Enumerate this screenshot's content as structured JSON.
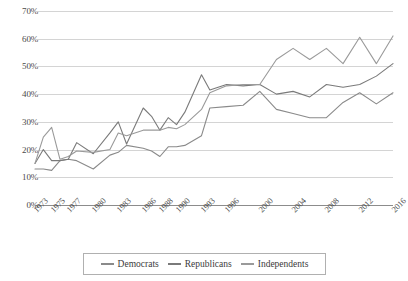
{
  "chart_data": {
    "type": "line",
    "title": "",
    "subtitle": "",
    "xlabel": "",
    "ylabel": "",
    "ylim": [
      0,
      70
    ],
    "xlim": [
      1973,
      2016
    ],
    "grid": true,
    "legend_position": "bottom",
    "y_ticks": [
      "0%",
      "10%",
      "20%",
      "30%",
      "40%",
      "50%",
      "60%",
      "70%"
    ],
    "y_tick_values": [
      0,
      10,
      20,
      30,
      40,
      50,
      60,
      70
    ],
    "x_tick_labels": [
      "1973",
      "1975",
      "1977",
      "1980",
      "1983",
      "1986",
      "1988",
      "1990",
      "1993",
      "1996",
      "2000",
      "2004",
      "2008",
      "2012",
      "2016"
    ],
    "x": [
      1973,
      1974,
      1975,
      1976,
      1977,
      1978,
      1980,
      1982,
      1983,
      1984,
      1986,
      1987,
      1988,
      1989,
      1990,
      1991,
      1993,
      1994,
      1996,
      1998,
      2000,
      2002,
      2004,
      2006,
      2008,
      2010,
      2012,
      2014,
      2016
    ],
    "series": [
      {
        "name": "Democrats",
        "color": "#8a8a8a",
        "values": [
          13,
          13,
          12.5,
          16,
          16.5,
          16,
          13,
          18,
          19,
          21.5,
          20.5,
          19.5,
          17.5,
          21,
          21,
          21.5,
          25,
          35,
          35.5,
          36,
          41,
          34.5,
          33,
          31.5,
          31.5,
          37,
          40.5,
          36.5,
          40.5
        ]
      },
      {
        "name": "Republicans",
        "color": "#7a7a7a",
        "values": [
          15,
          20,
          16,
          16,
          16.5,
          22.5,
          18.5,
          26,
          30,
          22,
          35,
          32,
          27,
          31.5,
          29,
          33.5,
          47,
          41.5,
          43.5,
          43,
          43.5,
          40,
          41,
          39,
          43.5,
          42.5,
          43.5,
          46.5,
          51
        ]
      },
      {
        "name": "Independents",
        "color": "#9a9a9a",
        "values": [
          15,
          24.5,
          28,
          16.5,
          17.5,
          19.5,
          19,
          20,
          26,
          25,
          27,
          27,
          27,
          28,
          27.5,
          29,
          34.5,
          40.5,
          43,
          43.5,
          43.5,
          52.5,
          56.5,
          52.5,
          56.5,
          51,
          60.5,
          51,
          61
        ]
      }
    ]
  },
  "legend": {
    "entries": [
      {
        "label": "Democrats",
        "swatch_color": "#8a8a8a"
      },
      {
        "label": "Republicans",
        "swatch_color": "#7a7a7a"
      },
      {
        "label": "Independents",
        "swatch_color": "#9a9a9a"
      }
    ]
  },
  "colors": {
    "gridline": "#d4d4d4",
    "axis": "#8c8c8c",
    "text": "#3b3b3b",
    "background": "#ffffff"
  }
}
